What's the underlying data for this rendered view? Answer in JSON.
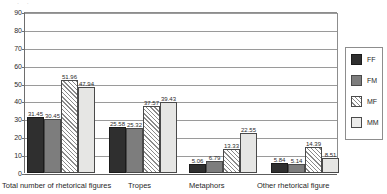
{
  "top_artifact": "· ·",
  "chart_data": {
    "type": "bar",
    "title": "",
    "subtitle": "",
    "xlabel": "",
    "ylabel": "",
    "ylim": [
      0,
      90
    ],
    "ytick_step": 10,
    "yticks": [
      90,
      80,
      70,
      60,
      50,
      40,
      30,
      20,
      10,
      0
    ],
    "grid": true,
    "grid_axis": "y",
    "legend_position": "right",
    "categories": [
      "Total number of rhetorical figures",
      "Tropes",
      "Metaphors",
      "Other rhetorical figure"
    ],
    "series": [
      {
        "name": "FF",
        "color": "#2f2f2f",
        "values": [
          31.45,
          25.58,
          5.06,
          5.84
        ]
      },
      {
        "name": "FM",
        "color": "#7d7d7d",
        "values": [
          30.45,
          25.32,
          6.79,
          5.14
        ]
      },
      {
        "name": "MF",
        "color": "#ffffff",
        "values": [
          51.96,
          37.57,
          13.33,
          14.39
        ]
      },
      {
        "name": "MM",
        "color": "#e6e6e4",
        "values": [
          47.94,
          39.43,
          22.55,
          8.51
        ]
      }
    ],
    "value_labels": [
      [
        "31.45",
        "30.45",
        "51.96",
        "47.94"
      ],
      [
        "25.58",
        "25.32",
        "37.57",
        "39.43"
      ],
      [
        "5.06",
        "6.79",
        "13.33",
        "22.55"
      ],
      [
        "5.84",
        "5.14",
        "14.39",
        "8.51"
      ]
    ]
  },
  "legend": {
    "items": [
      {
        "label": "FF"
      },
      {
        "label": "FM"
      },
      {
        "label": "MF"
      },
      {
        "label": "MM"
      }
    ]
  }
}
